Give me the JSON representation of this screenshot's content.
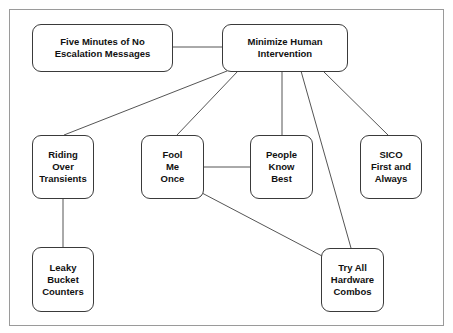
{
  "diagram": {
    "type": "concept-map",
    "nodes": [
      {
        "id": "five-minutes",
        "label": "Five Minutes of No\nEscalation Messages",
        "x": 32,
        "y": 24,
        "w": 141,
        "h": 48
      },
      {
        "id": "minimize-human",
        "label": "Minimize Human\nIntervention",
        "x": 222,
        "y": 24,
        "w": 126,
        "h": 48
      },
      {
        "id": "riding-over",
        "label": "Riding\nOver\nTransients",
        "x": 32,
        "y": 135,
        "w": 62,
        "h": 64
      },
      {
        "id": "fool-me-once",
        "label": "Fool\nMe\nOnce",
        "x": 141,
        "y": 135,
        "w": 63,
        "h": 64
      },
      {
        "id": "people-know-best",
        "label": "People\nKnow\nBest",
        "x": 250,
        "y": 135,
        "w": 63,
        "h": 64
      },
      {
        "id": "sico-first",
        "label": "SICO\nFirst and\nAlways",
        "x": 360,
        "y": 135,
        "w": 62,
        "h": 64
      },
      {
        "id": "leaky-bucket",
        "label": "Leaky\nBucket\nCounters",
        "x": 32,
        "y": 247,
        "w": 62,
        "h": 65
      },
      {
        "id": "try-all-hardware",
        "label": "Try All\nHardware\nCombos",
        "x": 321,
        "y": 248,
        "w": 63,
        "h": 64
      }
    ],
    "edges": [
      {
        "from": "five-minutes",
        "to": "minimize-human",
        "x1": 172,
        "y1": 47,
        "x2": 222,
        "y2": 47
      },
      {
        "from": "minimize-human",
        "to": "riding-over",
        "x1": 227,
        "y1": 71,
        "x2": 64,
        "y2": 135
      },
      {
        "from": "minimize-human",
        "to": "fool-me-once",
        "x1": 238,
        "y1": 71,
        "x2": 177,
        "y2": 135
      },
      {
        "from": "minimize-human",
        "to": "people-know-best",
        "x1": 282,
        "y1": 71,
        "x2": 282,
        "y2": 135
      },
      {
        "from": "minimize-human",
        "to": "try-all-hardware",
        "x1": 301,
        "y1": 71,
        "x2": 351,
        "y2": 248
      },
      {
        "from": "minimize-human",
        "to": "sico-first",
        "x1": 323,
        "y1": 71,
        "x2": 388,
        "y2": 135
      },
      {
        "from": "fool-me-once",
        "to": "people-know-best",
        "x1": 203,
        "y1": 167,
        "x2": 250,
        "y2": 167
      },
      {
        "from": "fool-me-once",
        "to": "try-all-hardware",
        "x1": 202,
        "y1": 193,
        "x2": 322,
        "y2": 256
      },
      {
        "from": "riding-over",
        "to": "leaky-bucket",
        "x1": 63,
        "y1": 198,
        "x2": 63,
        "y2": 247
      }
    ]
  }
}
